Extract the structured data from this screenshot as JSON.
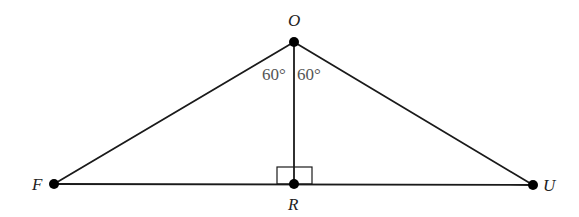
{
  "diagram": {
    "type": "geometry-triangle",
    "points": {
      "O": {
        "label": "O",
        "x": 294,
        "y": 42
      },
      "F": {
        "label": "F",
        "x": 54,
        "y": 184
      },
      "U": {
        "label": "U",
        "x": 533,
        "y": 185
      },
      "R": {
        "label": "R",
        "x": 294,
        "y": 184
      }
    },
    "segments": [
      {
        "from": "O",
        "to": "F"
      },
      {
        "from": "O",
        "to": "U"
      },
      {
        "from": "F",
        "to": "U"
      },
      {
        "from": "O",
        "to": "R"
      }
    ],
    "angles": [
      {
        "label": "60°",
        "at": "O",
        "between": [
          "F",
          "R"
        ]
      },
      {
        "label": "60°",
        "at": "O",
        "between": [
          "R",
          "U"
        ]
      }
    ],
    "right_angle": {
      "at": "R",
      "between": [
        "O",
        "F"
      ]
    },
    "labels": {
      "O": "O",
      "F": "F",
      "U": "U",
      "R": "R",
      "angle_left": "60°",
      "angle_right": "60°"
    },
    "colors": {
      "line": "#1a1a1a",
      "point": "#000000",
      "angle_text": "#555555",
      "point_text": "#222222"
    }
  }
}
